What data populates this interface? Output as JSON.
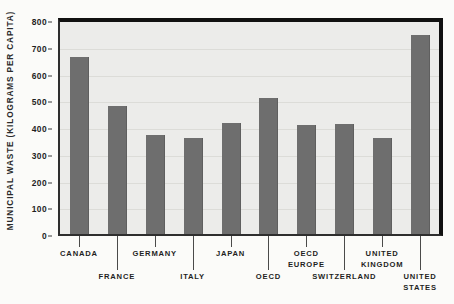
{
  "chart_data": {
    "type": "bar",
    "title": "",
    "subtitle": "",
    "xlabel": "",
    "ylabel": "MUNICIPAL WASTE (KILOGRAMS PER CAPITA)",
    "ylim": [
      0,
      800
    ],
    "ytick_labels": [
      "0",
      "100",
      "200",
      "300",
      "400",
      "500",
      "600",
      "700",
      "800"
    ],
    "ytick_values": [
      0,
      100,
      200,
      300,
      400,
      500,
      600,
      700,
      800
    ],
    "grid": true,
    "grid_axis": "y",
    "legend": false,
    "legend_position": "none",
    "categories": [
      "CANADA",
      "FRANCE",
      "GERMANY",
      "ITALY",
      "JAPAN",
      "OECD",
      "OECD EUROPE",
      "SWITZERLAND",
      "UNITED KINGDOM",
      "UNITED STATES"
    ],
    "category_label_lines": [
      [
        "CANADA"
      ],
      [
        "FRANCE"
      ],
      [
        "GERMANY"
      ],
      [
        "ITALY"
      ],
      [
        "JAPAN"
      ],
      [
        "OECD"
      ],
      [
        "OECD",
        "EUROPE"
      ],
      [
        "SWITZERLAND"
      ],
      [
        "UNITED",
        "KINGDOM"
      ],
      [
        "UNITED",
        "STATES"
      ]
    ],
    "category_label_row": [
      "top",
      "bottom",
      "top",
      "bottom",
      "top",
      "bottom",
      "top",
      "bottom",
      "top",
      "bottom"
    ],
    "values": [
      663,
      478,
      370,
      358,
      415,
      508,
      408,
      410,
      360,
      744
    ],
    "bar_color": "#6e6e6e",
    "plot_background": "#ececea",
    "frame_color": "#111111",
    "gridline_color": "#dcdcd8",
    "text_color": "#1f1f1f"
  }
}
